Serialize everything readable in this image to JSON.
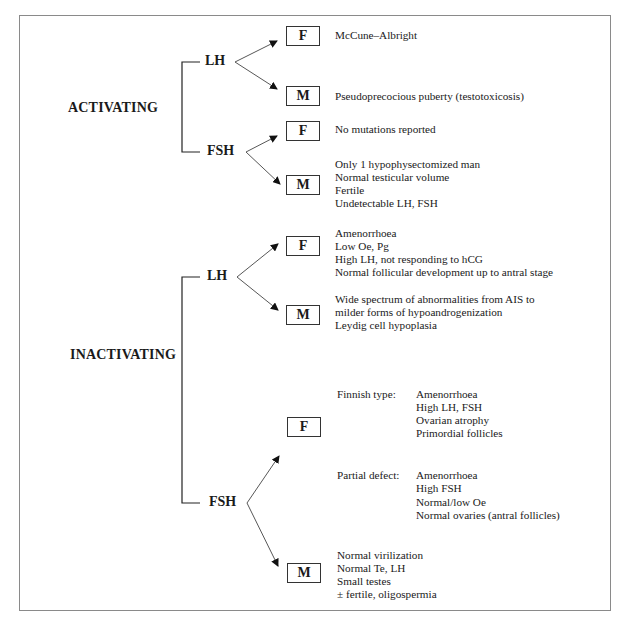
{
  "diagram": {
    "sections": [
      {
        "label": "ACTIVATING",
        "hormones": [
          {
            "name": "LH",
            "branches": [
              {
                "sex": "F",
                "lines": [
                  "McCune–Albright"
                ]
              },
              {
                "sex": "M",
                "lines": [
                  "Pseudoprecocious puberty (testotoxicosis)"
                ]
              }
            ]
          },
          {
            "name": "FSH",
            "branches": [
              {
                "sex": "F",
                "lines": [
                  "No mutations reported"
                ]
              },
              {
                "sex": "M",
                "lines": [
                  "Only 1 hypophysectomized man",
                  "Normal testicular volume",
                  "Fertile",
                  "Undetectable LH, FSH"
                ]
              }
            ]
          }
        ]
      },
      {
        "label": "INACTIVATING",
        "hormones": [
          {
            "name": "LH",
            "branches": [
              {
                "sex": "F",
                "lines": [
                  "Amenorrhoea",
                  "Low Oe, Pg",
                  "High LH, not responding to hCG",
                  "Normal follicular development up to antral stage"
                ]
              },
              {
                "sex": "M",
                "lines": [
                  "Wide spectrum of abnormalities from AIS to",
                  "milder forms of hypoandrogenization",
                  "Leydig cell hypoplasia"
                ]
              }
            ]
          },
          {
            "name": "FSH",
            "branches": [
              {
                "sex": "F",
                "subtypes": [
                  {
                    "label": "Finnish type:",
                    "lines": [
                      "Amenorrhoea",
                      "High LH, FSH",
                      "Ovarian atrophy",
                      "Primordial follicles"
                    ]
                  },
                  {
                    "label": "Partial defect:",
                    "lines": [
                      "Amenorrhoea",
                      "High FSH",
                      "Normal/low Oe",
                      "Normal ovaries (antral follicles)"
                    ]
                  }
                ]
              },
              {
                "sex": "M",
                "lines": [
                  "Normal virilization",
                  "Normal Te, LH",
                  "Small testes",
                  "± fertile, oligospermia"
                ]
              }
            ]
          }
        ]
      }
    ]
  }
}
